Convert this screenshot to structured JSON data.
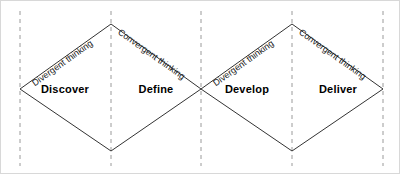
{
  "diagram": {
    "name": "double-diamond-design-process",
    "background_color": "#ffffff",
    "stroke_color": "#333333",
    "dashed_color": "#9a9a9a",
    "border_color": "#d8d8d8",
    "phases": [
      {
        "label": "Discover",
        "x": 64,
        "y": 88
      },
      {
        "label": "Define",
        "x": 155,
        "y": 88
      },
      {
        "label": "Develop",
        "x": 246,
        "y": 88
      },
      {
        "label": "Deliver",
        "x": 337,
        "y": 88
      }
    ],
    "thinking_labels": [
      {
        "label": "Divergent thinking",
        "x": 29,
        "y": 78,
        "angle": -35
      },
      {
        "label": "Convergent thinking",
        "x": 119,
        "y": 25,
        "angle": 35
      },
      {
        "label": "Divergent thinking",
        "x": 210,
        "y": 78,
        "angle": -35
      },
      {
        "label": "Convergent thinking",
        "x": 300,
        "y": 25,
        "angle": 35
      }
    ],
    "diamonds": [
      {
        "left": 19,
        "mid": 110,
        "right": 200,
        "top": 23,
        "bottom": 150,
        "center_y": 88
      },
      {
        "left": 200,
        "mid": 291,
        "right": 382,
        "top": 23,
        "bottom": 150,
        "center_y": 88
      }
    ],
    "dashed_lines": [
      {
        "x": 19,
        "y1": 10,
        "y2": 165
      },
      {
        "x": 110,
        "y1": 10,
        "y2": 165
      },
      {
        "x": 200,
        "y1": 10,
        "y2": 165
      },
      {
        "x": 291,
        "y1": 10,
        "y2": 165
      },
      {
        "x": 382,
        "y1": 10,
        "y2": 165
      }
    ]
  }
}
